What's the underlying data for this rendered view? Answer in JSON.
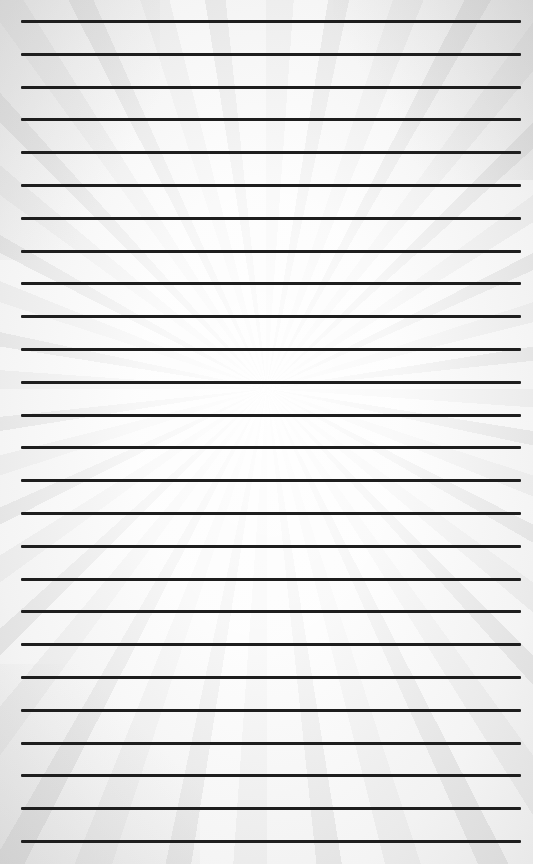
{
  "page": {
    "type": "lined-paper",
    "line_count": 26,
    "line_color": "#1e1e1e",
    "background_color": "#f4f4f4"
  }
}
